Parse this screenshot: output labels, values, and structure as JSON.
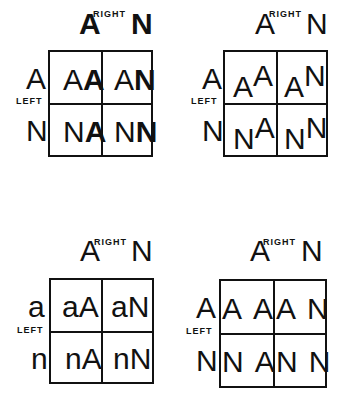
{
  "panels": [
    {
      "id": "bold-second",
      "right_label": "RIGHT",
      "left_label": "LEFT",
      "columns": [
        "A",
        "N"
      ],
      "rows": [
        "A",
        "N"
      ],
      "cells": [
        {
          "first": "A",
          "second": "A"
        },
        {
          "first": "A",
          "second": "N"
        },
        {
          "first": "N",
          "second": "A"
        },
        {
          "first": "N",
          "second": "N"
        }
      ],
      "style": "second letter bold"
    },
    {
      "id": "raised-second",
      "right_label": "RIGHT",
      "left_label": "LEFT",
      "columns": [
        "A",
        "N"
      ],
      "rows": [
        "A",
        "N"
      ],
      "cells": [
        {
          "first": "A",
          "second": "A"
        },
        {
          "first": "A",
          "second": "N"
        },
        {
          "first": "N",
          "second": "A"
        },
        {
          "first": "N",
          "second": "N"
        }
      ],
      "style": "second letter raised"
    },
    {
      "id": "lowercase-first",
      "right_label": "RIGHT",
      "left_label": "LEFT",
      "columns": [
        "A",
        "N"
      ],
      "rows": [
        "a",
        "n"
      ],
      "cells": [
        {
          "first": "a",
          "second": "A"
        },
        {
          "first": "a",
          "second": "N"
        },
        {
          "first": "n",
          "second": "A"
        },
        {
          "first": "n",
          "second": "N"
        }
      ],
      "style": "first letter lowercase"
    },
    {
      "id": "spaced",
      "right_label": "RIGHT",
      "left_label": "LEFT",
      "columns": [
        "A",
        "N"
      ],
      "rows": [
        "A",
        "N"
      ],
      "cells": [
        {
          "first": "A",
          "second": "A"
        },
        {
          "first": "A",
          "second": "N"
        },
        {
          "first": "N",
          "second": "A"
        },
        {
          "first": "N",
          "second": "N"
        }
      ],
      "style": "letters spaced apart"
    }
  ]
}
